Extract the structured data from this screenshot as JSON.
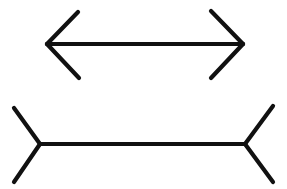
{
  "figure": {
    "name": "muller-lyer-illusion",
    "background_color": "#ffffff",
    "stroke_color": "#111111",
    "shaft_stroke_width": 4,
    "fin_stroke_width": 4.2,
    "canvas": {
      "width": 287,
      "height": 189
    },
    "shapes": [
      {
        "id": "top-figure",
        "label": "double-headed-arrow-outward-fins",
        "shaft": {
          "x1": 47,
          "y1": 44,
          "x2": 243,
          "y2": 44,
          "length_px": 196
        },
        "fins": [
          {
            "id": "top-left-upper-fin",
            "x1": 47,
            "y1": 44,
            "x2": 78,
            "y2": 12
          },
          {
            "id": "top-left-lower-fin",
            "x1": 47,
            "y1": 44,
            "x2": 79,
            "y2": 78
          },
          {
            "id": "top-right-upper-fin",
            "x1": 243,
            "y1": 44,
            "x2": 211,
            "y2": 11
          },
          {
            "id": "top-right-lower-fin",
            "x1": 243,
            "y1": 44,
            "x2": 211,
            "y2": 78
          }
        ]
      },
      {
        "id": "bottom-figure",
        "label": "double-tailed-line-inward-fins",
        "shaft": {
          "x1": 40,
          "y1": 144,
          "x2": 245,
          "y2": 144,
          "length_px": 205
        },
        "fins": [
          {
            "id": "bottom-left-upper-fin",
            "x1": 40,
            "y1": 144,
            "x2": 14,
            "y2": 108
          },
          {
            "id": "bottom-left-lower-fin",
            "x1": 40,
            "y1": 144,
            "x2": 14,
            "y2": 182
          },
          {
            "id": "bottom-right-upper-fin",
            "x1": 245,
            "y1": 144,
            "x2": 273,
            "y2": 106
          },
          {
            "id": "bottom-right-lower-fin",
            "x1": 245,
            "y1": 144,
            "x2": 273,
            "y2": 182
          }
        ]
      }
    ]
  }
}
